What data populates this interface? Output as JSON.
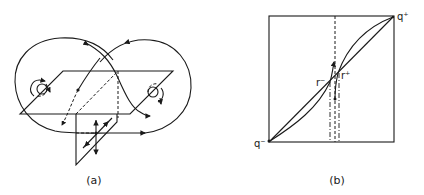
{
  "figure": {
    "panels": [
      {
        "id": "a",
        "caption": "(a)",
        "description": "Figure-eight orbit linking two rotation points across a horizontal parallelogram plane, with a vertical half-plane below"
      },
      {
        "id": "b",
        "caption": "(b)",
        "description": "Square with diagonal and S-shaped curves between q- and q+, crossing near r- and r+ with dash-dot vertical lines",
        "labels": {
          "q_plus": "q⁺",
          "q_minus": "q⁻",
          "r_minus": "r⁻",
          "r_plus": "r⁺"
        }
      }
    ],
    "colors": {
      "ink": "#1a1a1a",
      "background": "#ffffff"
    }
  }
}
